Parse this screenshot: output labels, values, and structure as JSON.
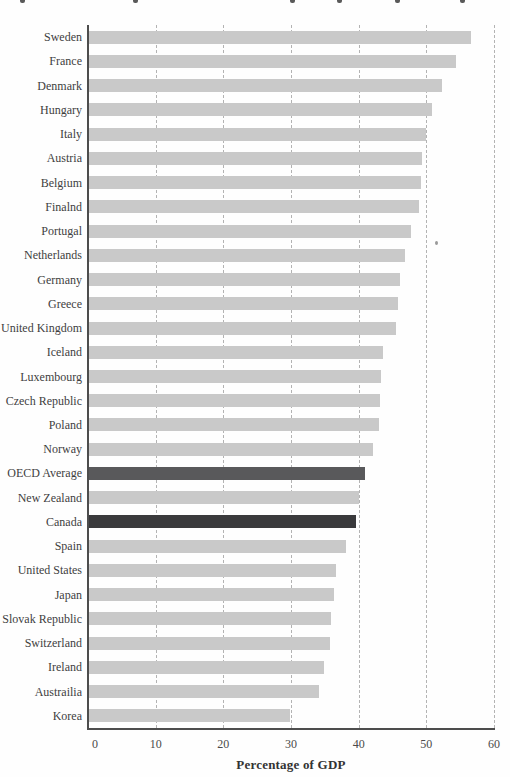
{
  "figure": {
    "cropped_title_fragments_x": [
      20,
      133,
      290,
      337,
      395,
      460
    ],
    "speck": {
      "x": 435,
      "y": 241
    }
  },
  "chart_data": {
    "type": "bar",
    "orientation": "horizontal",
    "title": "",
    "xlabel": "Percentage of GDP",
    "ylabel": "",
    "xlim": [
      0,
      60
    ],
    "xticks": [
      0,
      10,
      20,
      30,
      40,
      50,
      60
    ],
    "grid": "vertical-dashed-10-unit",
    "legend_position": "none",
    "categories": [
      "Sweden",
      "France",
      "Denmark",
      "Hungary",
      "Italy",
      "Austria",
      "Belgium",
      "Finalnd",
      "Portugal",
      "Netherlands",
      "Germany",
      "Greece",
      "United Kingdom",
      "Iceland",
      "Luxembourg",
      "Czech Republic",
      "Poland",
      "Norway",
      "OECD Average",
      "New Zealand",
      "Canada",
      "Spain",
      "United States",
      "Japan",
      "Slovak Republic",
      "Switzerland",
      "Ireland",
      "Austrailia",
      "Korea"
    ],
    "values": [
      56.4,
      54.2,
      52.2,
      50.7,
      49.8,
      49.2,
      49.0,
      48.8,
      47.6,
      46.7,
      46.0,
      45.6,
      45.4,
      43.5,
      43.2,
      43.0,
      42.8,
      41.9,
      40.8,
      39.9,
      39.4,
      38.0,
      36.5,
      36.2,
      35.7,
      35.6,
      34.7,
      34.0,
      29.7
    ],
    "highlight_mid": "OECD Average",
    "highlight_dark": "Canada",
    "colors": {
      "bar_default": "#c9c9c9",
      "bar_oecd_average": "#59595b",
      "bar_canada": "#3a3a3c",
      "axis": "#4d4d4d",
      "gridline": "#b3b3b3",
      "text": "#3e3e3e"
    }
  }
}
